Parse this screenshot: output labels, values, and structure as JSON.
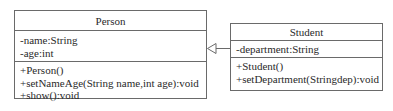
{
  "diagram": {
    "type": "UML class diagram",
    "classes": [
      {
        "name": "Person",
        "attributes": [
          "-name:String",
          "-age:int"
        ],
        "methods": [
          "+Person()",
          "+setNameAge(String name,int age):void",
          "+show():void"
        ]
      },
      {
        "name": "Student",
        "attributes": [
          "-department:String"
        ],
        "methods": [
          "+Student()",
          "+setDepartment(Stringdep):void"
        ]
      }
    ],
    "relationships": [
      {
        "type": "generalization",
        "from": "Student",
        "to": "Person",
        "arrowhead": "hollow-triangle"
      }
    ],
    "colors": {
      "line": "#6a6a6a",
      "text": "#2a2a2a",
      "background": "#ffffff"
    }
  }
}
